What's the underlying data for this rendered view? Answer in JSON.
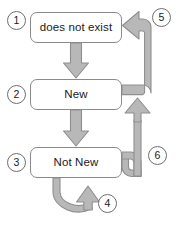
{
  "diagram": {
    "type": "state-transition-diagram",
    "palette": {
      "arrow_fill": "#b8b8b8",
      "arrow_stroke": "#8f8f8f",
      "box_border": "#8a8a8a",
      "box_fill": "#ffffff",
      "text": "#1a1a1a",
      "background": "#ffffff"
    },
    "states": [
      {
        "id": "does-not-exist",
        "label": "does not exist",
        "marker": "1"
      },
      {
        "id": "new",
        "label": "New",
        "marker": "2"
      },
      {
        "id": "not-new",
        "label": "Not New",
        "marker": "3"
      }
    ],
    "markers": [
      {
        "id": "marker-1",
        "label": "1",
        "annotates": "does not exist"
      },
      {
        "id": "marker-2",
        "label": "2",
        "annotates": "New"
      },
      {
        "id": "marker-3",
        "label": "3",
        "annotates": "Not New"
      },
      {
        "id": "marker-4",
        "label": "4",
        "annotates": "Not New self loop"
      },
      {
        "id": "marker-5",
        "label": "5",
        "annotates": "New to does not exist"
      },
      {
        "id": "marker-6",
        "label": "6",
        "annotates": "Not New to New"
      }
    ],
    "transitions": [
      {
        "id": "t1",
        "from": "does not exist",
        "to": "New",
        "marker": null
      },
      {
        "id": "t2",
        "from": "New",
        "to": "Not New",
        "marker": null
      },
      {
        "id": "t4",
        "from": "Not New",
        "to": "Not New",
        "marker": "4"
      },
      {
        "id": "t5",
        "from": "New",
        "to": "does not exist",
        "marker": "5"
      },
      {
        "id": "t6",
        "from": "Not New",
        "to": "New",
        "marker": "6"
      }
    ]
  }
}
